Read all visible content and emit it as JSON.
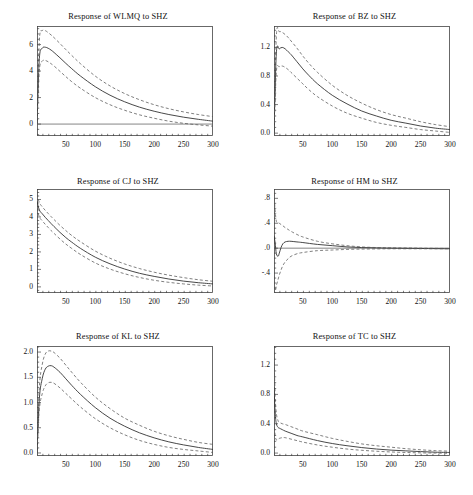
{
  "figure": {
    "kind": "impulse-response-grid",
    "rows": 3,
    "cols": 2,
    "background": "#ffffff",
    "line_color": "#333333",
    "band_color": "#555555",
    "axis_color": "#444444"
  },
  "chart_data": [
    {
      "type": "line",
      "title": "Response of WLMQ to SHZ",
      "xlabel": "",
      "ylabel": "",
      "xlim": [
        1,
        300
      ],
      "ylim": [
        -0.9,
        7.4
      ],
      "xticks": [
        50,
        100,
        150,
        200,
        250,
        300
      ],
      "xticklabels": [
        "50",
        "100",
        "150",
        "200",
        "250",
        "300"
      ],
      "yticks": [
        0,
        2,
        4,
        6
      ],
      "yticklabels": [
        "0",
        "2",
        "4",
        "6"
      ],
      "grid": false,
      "legend": "none",
      "zero_line": true,
      "x": [
        1,
        5,
        10,
        15,
        20,
        25,
        30,
        40,
        50,
        60,
        75,
        100,
        125,
        150,
        175,
        200,
        225,
        250,
        275,
        300
      ],
      "series": [
        {
          "name": "response",
          "style": "solid",
          "values": [
            0.0,
            4.95,
            5.72,
            5.8,
            5.72,
            5.58,
            5.4,
            5.0,
            4.58,
            4.18,
            3.62,
            2.82,
            2.18,
            1.68,
            1.28,
            0.97,
            0.72,
            0.52,
            0.36,
            0.22
          ]
        },
        {
          "name": "upper-band",
          "style": "dashed",
          "values": [
            0.0,
            6.3,
            7.05,
            7.05,
            6.9,
            6.72,
            6.52,
            6.08,
            5.62,
            5.18,
            4.55,
            3.62,
            2.88,
            2.3,
            1.84,
            1.46,
            1.16,
            0.92,
            0.72,
            0.56
          ]
        },
        {
          "name": "lower-band",
          "style": "dashed",
          "values": [
            0.0,
            4.05,
            4.75,
            4.8,
            4.7,
            4.55,
            4.38,
            3.98,
            3.58,
            3.2,
            2.7,
            2.0,
            1.46,
            1.04,
            0.7,
            0.44,
            0.22,
            0.06,
            -0.06,
            -0.16
          ]
        }
      ]
    },
    {
      "type": "line",
      "title": "Response of BZ to SHZ",
      "xlabel": "",
      "ylabel": "",
      "xlim": [
        1,
        300
      ],
      "ylim": [
        -0.04,
        1.5
      ],
      "xticks": [
        50,
        100,
        150,
        200,
        250,
        300
      ],
      "xticklabels": [
        "50",
        "100",
        "150",
        "200",
        "250",
        "300"
      ],
      "yticks": [
        0.0,
        0.4,
        0.8,
        1.2
      ],
      "yticklabels": [
        "0.0",
        "0.4",
        "0.8",
        "1.2"
      ],
      "grid": false,
      "legend": "none",
      "zero_line": false,
      "x": [
        1,
        5,
        10,
        15,
        20,
        25,
        30,
        40,
        50,
        60,
        75,
        100,
        125,
        150,
        175,
        200,
        225,
        250,
        275,
        300
      ],
      "series": [
        {
          "name": "response",
          "style": "solid",
          "values": [
            0.0,
            1.12,
            1.18,
            1.2,
            1.18,
            1.14,
            1.1,
            1.0,
            0.9,
            0.81,
            0.69,
            0.53,
            0.41,
            0.31,
            0.24,
            0.18,
            0.14,
            0.1,
            0.07,
            0.05
          ]
        },
        {
          "name": "upper-band",
          "style": "dashed",
          "values": [
            0.0,
            1.36,
            1.42,
            1.41,
            1.38,
            1.34,
            1.29,
            1.19,
            1.08,
            0.98,
            0.85,
            0.67,
            0.53,
            0.42,
            0.33,
            0.26,
            0.21,
            0.16,
            0.12,
            0.09
          ]
        },
        {
          "name": "lower-band",
          "style": "dashed",
          "values": [
            0.0,
            0.86,
            0.93,
            0.94,
            0.92,
            0.89,
            0.85,
            0.77,
            0.69,
            0.61,
            0.51,
            0.38,
            0.28,
            0.21,
            0.15,
            0.11,
            0.08,
            0.05,
            0.03,
            0.01
          ]
        }
      ]
    },
    {
      "type": "line",
      "title": "Response of CJ to SHZ",
      "xlabel": "",
      "ylabel": "",
      "xlim": [
        1,
        300
      ],
      "ylim": [
        -0.35,
        5.6
      ],
      "xticks": [
        50,
        100,
        150,
        200,
        250,
        300
      ],
      "xticklabels": [
        "50",
        "100",
        "150",
        "200",
        "250",
        "300"
      ],
      "yticks": [
        0,
        1,
        2,
        3,
        4,
        5
      ],
      "yticklabels": [
        "0",
        "1",
        "2",
        "3",
        "4",
        "5"
      ],
      "grid": false,
      "legend": "none",
      "zero_line": false,
      "x": [
        1,
        5,
        10,
        15,
        20,
        25,
        30,
        40,
        50,
        60,
        75,
        100,
        125,
        150,
        175,
        200,
        225,
        250,
        275,
        300
      ],
      "series": [
        {
          "name": "response",
          "style": "solid",
          "values": [
            4.9,
            4.4,
            4.18,
            3.98,
            3.8,
            3.62,
            3.45,
            3.12,
            2.82,
            2.56,
            2.2,
            1.7,
            1.32,
            1.02,
            0.78,
            0.6,
            0.45,
            0.33,
            0.24,
            0.17
          ]
        },
        {
          "name": "upper-band",
          "style": "dashed",
          "values": [
            5.3,
            4.82,
            4.58,
            4.38,
            4.2,
            4.02,
            3.85,
            3.52,
            3.22,
            2.94,
            2.58,
            2.05,
            1.64,
            1.31,
            1.05,
            0.84,
            0.67,
            0.53,
            0.41,
            0.32
          ]
        },
        {
          "name": "lower-band",
          "style": "dashed",
          "values": [
            4.5,
            4.0,
            3.78,
            3.58,
            3.4,
            3.22,
            3.06,
            2.74,
            2.45,
            2.2,
            1.85,
            1.37,
            1.02,
            0.75,
            0.54,
            0.38,
            0.26,
            0.17,
            0.1,
            0.05
          ]
        }
      ]
    },
    {
      "type": "line",
      "title": "Response of HM to SHZ",
      "xlabel": "",
      "ylabel": "",
      "xlim": [
        1,
        300
      ],
      "ylim": [
        -0.72,
        0.95
      ],
      "xticks": [
        50,
        100,
        150,
        200,
        250,
        300
      ],
      "xticklabels": [
        "50",
        "100",
        "150",
        "200",
        "250",
        "300"
      ],
      "yticks": [
        -0.4,
        0.0,
        0.4,
        0.8
      ],
      "yticklabels": [
        "-.4",
        ".0",
        ".4",
        ".8"
      ],
      "grid": false,
      "legend": "none",
      "zero_line": true,
      "x": [
        1,
        3,
        5,
        8,
        10,
        13,
        16,
        20,
        25,
        30,
        40,
        50,
        75,
        100,
        125,
        150,
        175,
        200,
        250,
        300
      ],
      "series": [
        {
          "name": "response",
          "style": "solid",
          "values": [
            0.2,
            0.08,
            -0.09,
            -0.13,
            -0.08,
            0.01,
            0.07,
            0.1,
            0.11,
            0.11,
            0.1,
            0.09,
            0.06,
            0.04,
            0.02,
            0.01,
            0.005,
            0.0,
            -0.005,
            -0.01
          ]
        },
        {
          "name": "upper-band",
          "style": "dashed",
          "values": [
            0.88,
            0.6,
            0.43,
            0.41,
            0.4,
            0.38,
            0.36,
            0.33,
            0.3,
            0.27,
            0.22,
            0.18,
            0.11,
            0.07,
            0.04,
            0.02,
            0.01,
            0.005,
            0.0,
            -0.005
          ]
        },
        {
          "name": "lower-band",
          "style": "dashed",
          "values": [
            -0.45,
            -0.68,
            -0.6,
            -0.5,
            -0.43,
            -0.35,
            -0.28,
            -0.22,
            -0.17,
            -0.13,
            -0.09,
            -0.07,
            -0.04,
            -0.03,
            -0.02,
            -0.015,
            -0.012,
            -0.01,
            -0.01,
            -0.01
          ]
        }
      ]
    },
    {
      "type": "line",
      "title": "Response of KL to SHZ",
      "xlabel": "",
      "ylabel": "",
      "xlim": [
        1,
        300
      ],
      "ylim": [
        -0.06,
        2.12
      ],
      "xticks": [
        50,
        100,
        150,
        200,
        250,
        300
      ],
      "xticklabels": [
        "50",
        "100",
        "150",
        "200",
        "250",
        "300"
      ],
      "yticks": [
        0.0,
        0.5,
        1.0,
        1.5,
        2.0
      ],
      "yticklabels": [
        "0.0",
        "0.5",
        "1.0",
        "1.5",
        "2.0"
      ],
      "grid": false,
      "legend": "none",
      "zero_line": false,
      "x": [
        1,
        5,
        10,
        15,
        20,
        25,
        30,
        40,
        50,
        60,
        75,
        100,
        125,
        150,
        175,
        200,
        225,
        250,
        275,
        300
      ],
      "series": [
        {
          "name": "response",
          "style": "solid",
          "values": [
            0.0,
            1.08,
            1.48,
            1.66,
            1.72,
            1.73,
            1.7,
            1.6,
            1.47,
            1.34,
            1.16,
            0.9,
            0.69,
            0.53,
            0.4,
            0.3,
            0.22,
            0.16,
            0.11,
            0.07
          ]
        },
        {
          "name": "upper-band",
          "style": "dashed",
          "values": [
            0.0,
            1.3,
            1.76,
            1.96,
            2.02,
            2.02,
            1.99,
            1.88,
            1.74,
            1.6,
            1.4,
            1.11,
            0.88,
            0.69,
            0.55,
            0.43,
            0.34,
            0.27,
            0.21,
            0.17
          ]
        },
        {
          "name": "lower-band",
          "style": "dashed",
          "values": [
            0.0,
            0.86,
            1.18,
            1.33,
            1.39,
            1.4,
            1.38,
            1.29,
            1.18,
            1.07,
            0.91,
            0.68,
            0.5,
            0.36,
            0.25,
            0.17,
            0.11,
            0.07,
            0.04,
            0.01
          ]
        }
      ]
    },
    {
      "type": "line",
      "title": "Response of TC to SHZ",
      "xlabel": "",
      "ylabel": "",
      "xlim": [
        1,
        300
      ],
      "ylim": [
        -0.04,
        1.46
      ],
      "xticks": [
        50,
        100,
        150,
        200,
        250,
        300
      ],
      "xticklabels": [
        "50",
        "100",
        "150",
        "200",
        "250",
        "300"
      ],
      "yticks": [
        0.0,
        0.4,
        0.8,
        1.2
      ],
      "yticklabels": [
        "0.0",
        "0.4",
        "0.8",
        "1.2"
      ],
      "grid": false,
      "legend": "none",
      "zero_line": false,
      "x": [
        1,
        3,
        5,
        8,
        10,
        15,
        20,
        30,
        40,
        50,
        75,
        100,
        125,
        150,
        175,
        200,
        225,
        250,
        275,
        300
      ],
      "series": [
        {
          "name": "response",
          "style": "solid",
          "values": [
            0.9,
            0.55,
            0.4,
            0.35,
            0.34,
            0.32,
            0.3,
            0.27,
            0.24,
            0.22,
            0.17,
            0.13,
            0.1,
            0.075,
            0.055,
            0.04,
            0.03,
            0.02,
            0.012,
            0.008
          ]
        },
        {
          "name": "upper-band",
          "style": "dashed",
          "values": [
            1.38,
            0.78,
            0.54,
            0.44,
            0.42,
            0.4,
            0.39,
            0.36,
            0.33,
            0.3,
            0.25,
            0.2,
            0.16,
            0.125,
            0.1,
            0.08,
            0.06,
            0.045,
            0.033,
            0.025
          ]
        },
        {
          "name": "lower-band",
          "style": "dashed",
          "values": [
            0.42,
            0.24,
            0.18,
            0.19,
            0.2,
            0.21,
            0.21,
            0.19,
            0.17,
            0.15,
            0.11,
            0.08,
            0.055,
            0.038,
            0.025,
            0.015,
            0.008,
            0.003,
            0.0,
            -0.003
          ]
        }
      ]
    }
  ]
}
